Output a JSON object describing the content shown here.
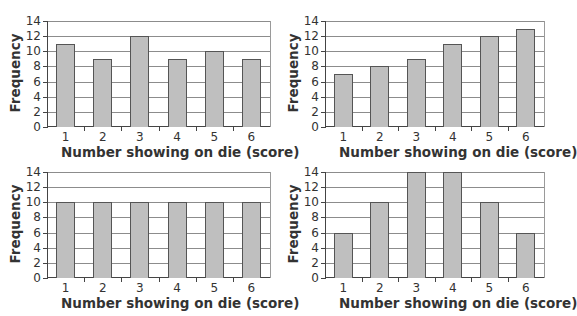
{
  "chart_data": [
    {
      "type": "bar",
      "position": "top-left",
      "categories": [
        "1",
        "2",
        "3",
        "4",
        "5",
        "6"
      ],
      "values": [
        11,
        9,
        12,
        9,
        10,
        9
      ],
      "xlabel": "Number showing on die (score)",
      "ylabel": "Frequency",
      "ylim": [
        0,
        14
      ],
      "yticks": [
        "0",
        "2",
        "4",
        "6",
        "8",
        "10",
        "12",
        "14"
      ],
      "grid": true
    },
    {
      "type": "bar",
      "position": "top-right",
      "categories": [
        "1",
        "2",
        "3",
        "4",
        "5",
        "6"
      ],
      "values": [
        7,
        8,
        9,
        11,
        12,
        13
      ],
      "xlabel": "Number showing on die (score)",
      "ylabel": "Frequency",
      "ylim": [
        0,
        14
      ],
      "yticks": [
        "0",
        "2",
        "4",
        "6",
        "8",
        "10",
        "12",
        "14"
      ],
      "grid": true
    },
    {
      "type": "bar",
      "position": "bottom-left",
      "categories": [
        "1",
        "2",
        "3",
        "4",
        "5",
        "6"
      ],
      "values": [
        10,
        10,
        10,
        10,
        10,
        10
      ],
      "xlabel": "Number showing on die (score)",
      "ylabel": "Frequency",
      "ylim": [
        0,
        14
      ],
      "yticks": [
        "0",
        "2",
        "4",
        "6",
        "8",
        "10",
        "12",
        "14"
      ],
      "grid": true
    },
    {
      "type": "bar",
      "position": "bottom-right",
      "categories": [
        "1",
        "2",
        "3",
        "4",
        "5",
        "6"
      ],
      "values": [
        6,
        10,
        14,
        14,
        10,
        6
      ],
      "xlabel": "Number showing on die (score)",
      "ylabel": "Frequency",
      "ylim": [
        0,
        14
      ],
      "yticks": [
        "0",
        "2",
        "4",
        "6",
        "8",
        "10",
        "12",
        "14"
      ],
      "grid": true
    }
  ],
  "colors": {
    "bar_fill": "#bfbfbf",
    "bar_border": "#555555",
    "gridline": "#8c8c8c",
    "axis": "#444444"
  }
}
